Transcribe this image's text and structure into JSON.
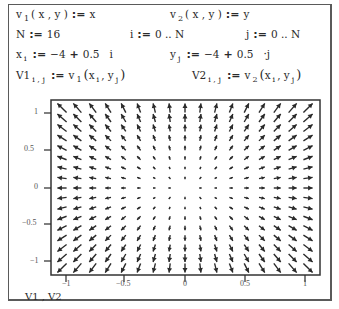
{
  "definitions": {
    "line1": {
      "left": {
        "name": "v",
        "sub": "1",
        "args": "( x , y )",
        "assign": ":=",
        "value": "x"
      },
      "right": {
        "name": "v",
        "sub": "2",
        "args": "( x , y )",
        "assign": ":=",
        "value": "y"
      }
    },
    "line2": {
      "a": {
        "name": "N",
        "assign": ":=",
        "value": "16"
      },
      "b": {
        "name": "i",
        "assign": ":=",
        "value": "0 .. N"
      },
      "c": {
        "name": "j",
        "assign": ":=",
        "value": "0 .. N"
      }
    },
    "line3": {
      "left": {
        "name": "x",
        "sub": "i",
        "assign": ":=",
        "value_a": "−4",
        "plus": "+",
        "value_b": "0.5",
        "var": "i"
      },
      "right": {
        "name": "y",
        "sub": "j",
        "assign": ":=",
        "value_a": "−4",
        "plus": "+",
        "value_b": "0.5",
        "var": "·j"
      }
    },
    "line4": {
      "left": {
        "name": "V1",
        "sub": "i , j",
        "assign": ":=",
        "fn": "v",
        "fn_sub": "1",
        "args_open": "(",
        "arg1": "x",
        "arg1_sub": "i",
        "sep": ",",
        "arg2": "y",
        "arg2_sub": "j",
        "args_close": ")"
      },
      "right": {
        "name": "V2",
        "sub": "i , j",
        "assign": ":=",
        "fn": "v",
        "fn_sub": "2",
        "args_open": "(",
        "arg1": "x",
        "arg1_sub": "i",
        "sep": ",",
        "arg2": "y",
        "arg2_sub": "j",
        "args_close": ")"
      }
    }
  },
  "plot": {
    "type": "vector_field",
    "caption": "V1 , V2",
    "x_ticks": [
      "−1",
      "−0.5",
      "0",
      "0.5",
      "1"
    ],
    "y_ticks": [
      "1",
      "0.5",
      "0",
      "−0.5",
      "−1"
    ],
    "grid_size": 17,
    "field": "v(x,y) = (x, y)",
    "color": "#2a2a2a"
  },
  "chart_data": {
    "type": "vector_field",
    "title": "",
    "series_label": "V1 , V2",
    "x": [
      -4,
      -3.5,
      -3,
      -2.5,
      -2,
      -1.5,
      -1,
      -0.5,
      0,
      0.5,
      1,
      1.5,
      2,
      2.5,
      3,
      3.5,
      4
    ],
    "y": [
      -4,
      -3.5,
      -3,
      -2.5,
      -2,
      -1.5,
      -1,
      -0.5,
      0,
      0.5,
      1,
      1.5,
      2,
      2.5,
      3,
      3.5,
      4
    ],
    "vector": {
      "u": "x",
      "v": "y"
    },
    "xlabel_ticks": [
      -1,
      -0.5,
      0,
      0.5,
      1
    ],
    "ylabel_ticks": [
      -1,
      -0.5,
      0,
      0.5,
      1
    ],
    "xlim": [
      -1,
      1
    ],
    "ylim": [
      -1,
      1
    ],
    "grid": false
  }
}
